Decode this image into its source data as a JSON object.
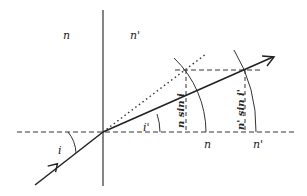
{
  "diagram": {
    "type": "refraction-construction",
    "colors": {
      "stroke": "#222222",
      "background": "#ffffff"
    },
    "labels": {
      "medium_left": "n",
      "medium_right": "n'",
      "angle_incidence": "i",
      "angle_refraction": "i'",
      "axis_n": "n",
      "axis_n_prime": "n'",
      "segment_n_sin_i": "n sin i",
      "segment_n_prime_sin_i_prime": "n' sin i'"
    },
    "elements": {
      "normal_line": "vertical interface line",
      "surface_dashed_line": "horizontal dashed reference line",
      "incident_ray": "incident ray with arrow",
      "refracted_ray": "refracted ray with arrow",
      "undeviated_extension": "dotted continuation of incident ray",
      "arc_n": "arc of radius n",
      "arc_n_prime": "arc of radius n'"
    }
  }
}
